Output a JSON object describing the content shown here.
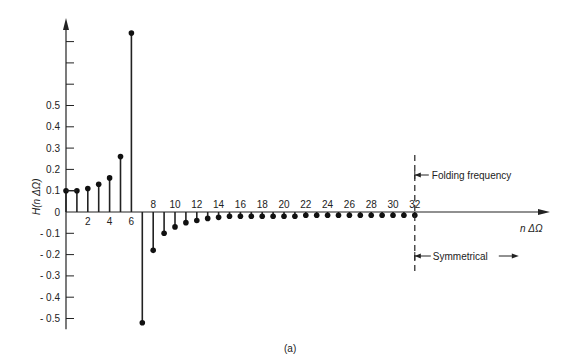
{
  "chart_data": {
    "type": "stem",
    "title": "",
    "caption": "(a)",
    "xlabel": "n ΔΩ",
    "ylabel": "H(n ΔΩ)",
    "x": [
      0,
      1,
      2,
      3,
      4,
      5,
      6,
      7,
      8,
      9,
      10,
      11,
      12,
      13,
      14,
      15,
      16,
      17,
      18,
      19,
      20,
      21,
      22,
      23,
      24,
      25,
      26,
      27,
      28,
      29,
      30,
      31,
      32
    ],
    "values": [
      0.1,
      0.1,
      0.11,
      0.13,
      0.16,
      0.26,
      0.84,
      -0.52,
      -0.18,
      -0.1,
      -0.07,
      -0.05,
      -0.04,
      -0.03,
      -0.025,
      -0.02,
      -0.02,
      -0.02,
      -0.02,
      -0.02,
      -0.02,
      -0.02,
      -0.015,
      -0.015,
      -0.015,
      -0.015,
      -0.015,
      -0.015,
      -0.015,
      -0.015,
      -0.015,
      -0.015,
      -0.015
    ],
    "x_tick_labels": [
      "2",
      "4",
      "6",
      "8",
      "10",
      "12",
      "14",
      "16",
      "18",
      "20",
      "22",
      "24",
      "26",
      "28",
      "30",
      "32"
    ],
    "x_ticks": [
      2,
      4,
      6,
      8,
      10,
      12,
      14,
      16,
      18,
      20,
      22,
      24,
      26,
      28,
      30,
      32
    ],
    "y_tick_labels": [
      "0.5",
      "0.4",
      "0.3",
      "0.2",
      "0.1",
      "0",
      "- 0.1",
      "- 0.2",
      "- 0.3",
      "- 0.4",
      "- 0.5"
    ],
    "y_ticks": [
      0.5,
      0.4,
      0.3,
      0.2,
      0.1,
      0,
      -0.1,
      -0.2,
      -0.3,
      -0.4,
      -0.5
    ],
    "y_unlabeled_ticks": [
      0.6,
      0.7,
      0.8
    ],
    "ylim": [
      -0.55,
      0.95
    ],
    "xlim": [
      0,
      36
    ],
    "grid": false,
    "annotations": [
      {
        "text": "Folding frequency",
        "at_x": 32,
        "style": "arrow-left to dashed line"
      },
      {
        "text": "Symmetrical",
        "at_x": 32,
        "style": "arrow-both from dashed line to right"
      }
    ],
    "vertical_marker": {
      "x": 32,
      "style": "dashed"
    }
  }
}
